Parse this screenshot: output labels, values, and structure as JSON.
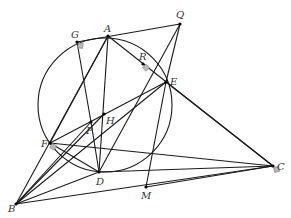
{
  "diagram": {
    "type": "geometry-figure",
    "circle": {
      "cx": 105,
      "cy": 105,
      "r": 67
    },
    "points": {
      "A": [
        108,
        36
      ],
      "G": [
        77,
        42
      ],
      "Q": [
        180,
        24
      ],
      "R": [
        143,
        64
      ],
      "E": [
        166,
        82
      ],
      "P": [
        91,
        122
      ],
      "H": [
        104,
        114
      ],
      "F": [
        50,
        143
      ],
      "D": [
        99,
        172
      ],
      "M": [
        146,
        187
      ],
      "C": [
        273,
        166
      ],
      "B": [
        16,
        204
      ]
    },
    "labels": [
      {
        "text": "A",
        "x": 104,
        "y": 32
      },
      {
        "text": "Q",
        "x": 176,
        "y": 18
      },
      {
        "text": "G",
        "x": 71,
        "y": 38
      },
      {
        "text": "R",
        "x": 139,
        "y": 60
      },
      {
        "text": "E",
        "x": 170,
        "y": 85
      },
      {
        "text": "H",
        "x": 106,
        "y": 124
      },
      {
        "text": "P",
        "x": 86,
        "y": 134
      },
      {
        "text": "F",
        "x": 41,
        "y": 147
      },
      {
        "text": "D",
        "x": 96,
        "y": 185
      },
      {
        "text": "M",
        "x": 141,
        "y": 199
      },
      {
        "text": "C",
        "x": 277,
        "y": 170
      },
      {
        "text": "B",
        "x": 8,
        "y": 212
      }
    ],
    "segments": [
      [
        "G",
        "Q"
      ],
      [
        "A",
        "D"
      ],
      [
        "A",
        "F"
      ],
      [
        "A",
        "C"
      ],
      [
        "Q",
        "E"
      ],
      [
        "Q",
        "D"
      ],
      [
        "G",
        "P"
      ],
      [
        "B",
        "A"
      ],
      [
        "B",
        "E"
      ],
      [
        "B",
        "D"
      ],
      [
        "B",
        "C"
      ],
      [
        "B",
        "P"
      ],
      [
        "F",
        "E"
      ],
      [
        "F",
        "D"
      ],
      [
        "F",
        "C"
      ],
      [
        "E",
        "M"
      ],
      [
        "E",
        "C"
      ],
      [
        "D",
        "C"
      ],
      [
        "M",
        "C"
      ],
      [
        "P",
        "D"
      ],
      [
        "B",
        "H"
      ]
    ],
    "right_angle_marks": [
      "G",
      "R",
      "F",
      "C"
    ]
  }
}
